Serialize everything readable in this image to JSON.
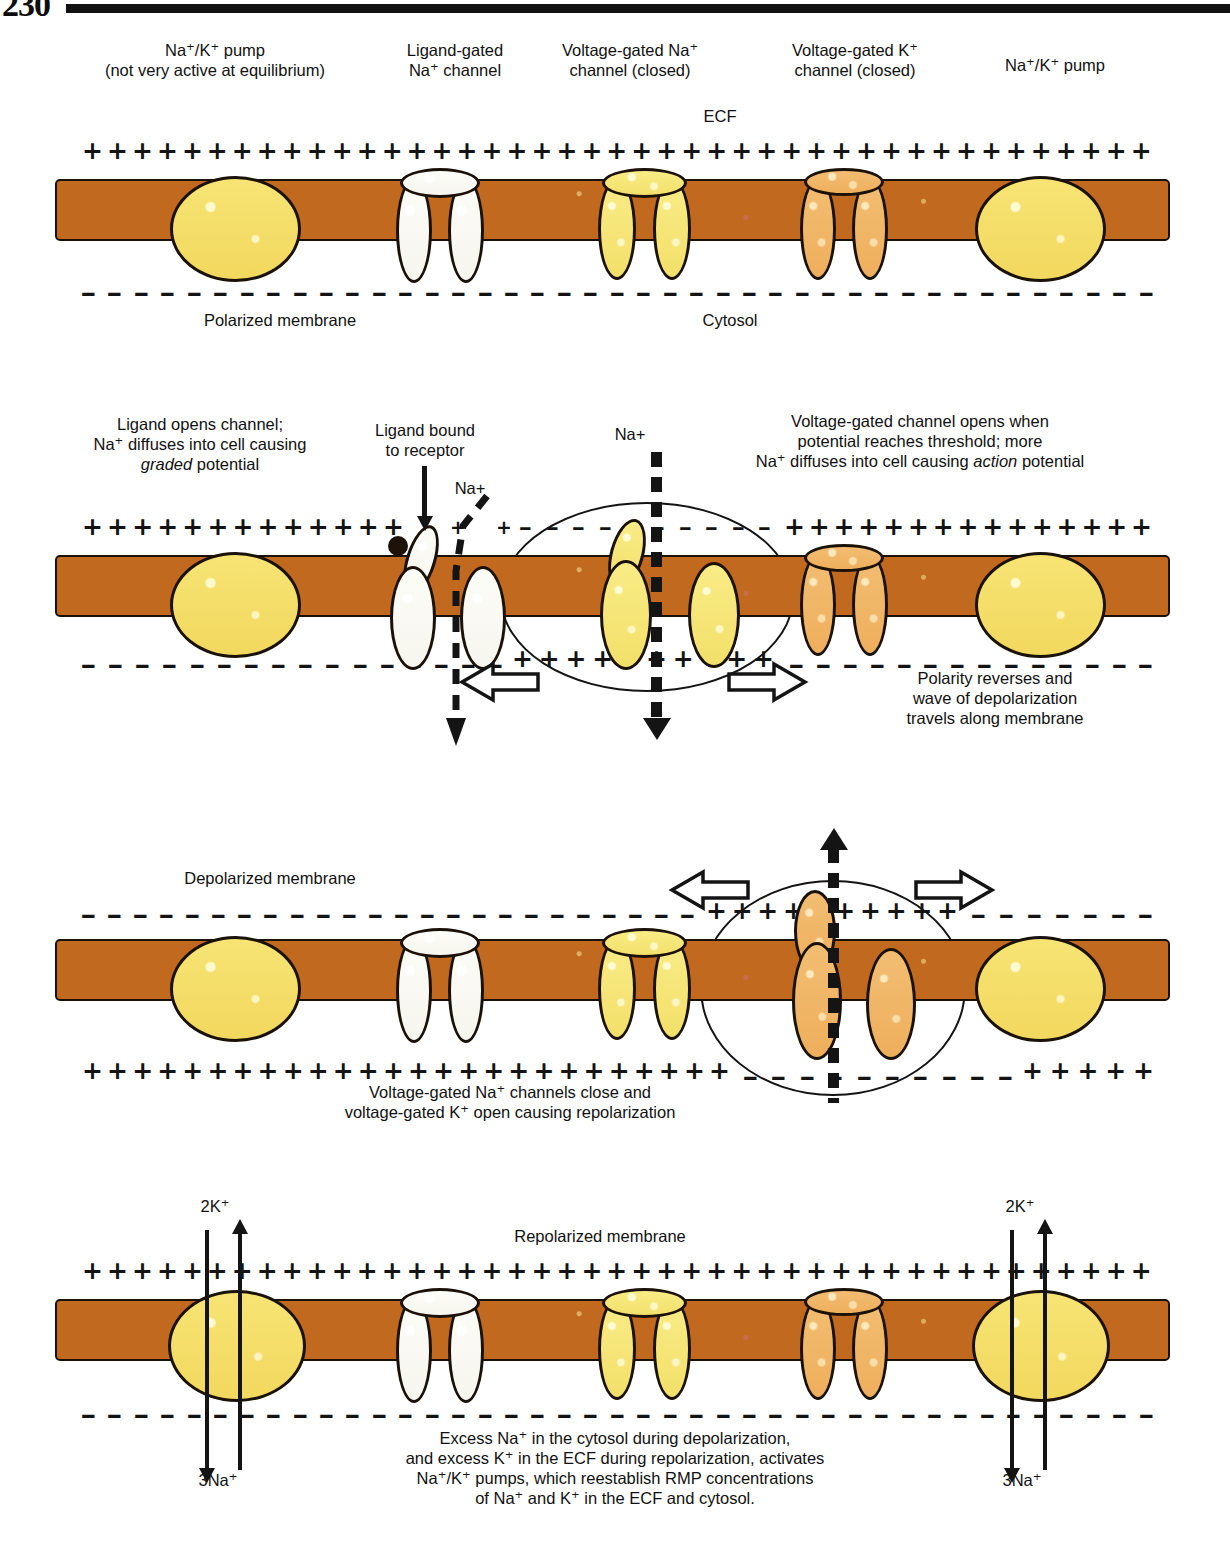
{
  "page": {
    "number": "230"
  },
  "labels": {
    "ecf": "ECF",
    "cytosol": "Cytosol",
    "na_plus": "Na+",
    "two_k": "2K⁺",
    "three_na": "3Na⁺"
  },
  "panel1": {
    "name": "polarized-membrane-panel",
    "headers": [
      {
        "line1": "Na⁺/K⁺ pump",
        "line2": "(not very active at equilibrium)"
      },
      {
        "line1": "Ligand-gated",
        "line2": "Na⁺ channel"
      },
      {
        "line1": "Voltage-gated Na⁺",
        "line2": "channel (closed)"
      },
      {
        "line1": "Voltage-gated K⁺",
        "line2": "channel (closed)"
      },
      {
        "line1": "Na⁺/K⁺ pump",
        "line2": ""
      }
    ],
    "caption": "Polarized membrane",
    "outside_charge": "+",
    "inside_charge": "–"
  },
  "panel2": {
    "name": "graded-and-action-potential-panel",
    "left_note": {
      "line1": "Ligand opens channel;",
      "line2": "Na⁺ diffuses into cell causing",
      "line3_italic": "graded",
      "line3_rest": " potential"
    },
    "ligand_note": {
      "line1": "Ligand bound",
      "line2": "to receptor"
    },
    "right_note": {
      "line1": "Voltage-gated channel opens when",
      "line2": "potential reaches threshold; more",
      "line3_a": "Na⁺ diffuses into cell causing ",
      "line3_italic": "action",
      "line3_b": " potential"
    },
    "polarity_note": {
      "line1": "Polarity reverses and",
      "line2": "wave of depolarization",
      "line3": "travels along membrane"
    }
  },
  "panel3": {
    "name": "repolarization-panel",
    "title": "Depolarized membrane",
    "caption": {
      "line1": "Voltage-gated Na⁺ channels close and",
      "line2": "voltage-gated K⁺ open causing repolarization"
    }
  },
  "panel4": {
    "name": "pump-restoration-panel",
    "title": "Repolarized membrane",
    "caption": {
      "line1": "Excess Na⁺ in the cytosol during depolarization,",
      "line2": "and excess K⁺ in the ECF during repolarization, activates",
      "line3": "Na⁺/K⁺ pumps, which reestablish RMP concentrations",
      "line4": "of Na⁺ and K⁺ in the ECF and cytosol."
    }
  },
  "colors": {
    "membrane": "#c1691f",
    "pump_yellow": "#f3dc6a",
    "na_channel_yellow": "#f6e77c",
    "k_channel_orange": "#f0b867",
    "ligand_channel_white": "#fbfaf3",
    "ink": "#141414"
  }
}
